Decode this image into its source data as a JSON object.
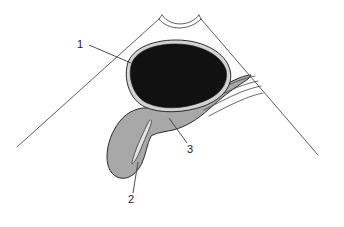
{
  "figure": {
    "background_color": "#ffffff",
    "width": 344,
    "height": 227
  },
  "palette": {
    "background": "#ffffff",
    "outline": "#2b2b2b",
    "frame_line": "#4a4a4a",
    "leader_line": "#3a3a3a",
    "dark_organ_fill": "#111111",
    "dark_organ_rim": "#cfcfcf",
    "shaded_organ_fill": "#a8a8a8",
    "lumen_fill": "#e8e8e8",
    "label_text": "#1a1a1a"
  },
  "callouts": [
    {
      "id": "callout-1",
      "label": "1",
      "label_x": 80,
      "label_y": 48,
      "leader_from_x": 89,
      "leader_from_y": 45,
      "leader_to_x": 131,
      "leader_to_y": 63,
      "points_to": "dark-organ"
    },
    {
      "id": "callout-2",
      "label": "2",
      "label_x": 129,
      "label_y": 202,
      "leader_from_x": 133,
      "leader_from_y": 193,
      "leader_to_x": 138,
      "leader_to_y": 162,
      "points_to": "shaded-organ-fundus"
    },
    {
      "id": "callout-3",
      "label": "3",
      "label_x": 187,
      "label_y": 152,
      "leader_from_x": 188,
      "leader_from_y": 143,
      "leader_to_x": 170,
      "leader_to_y": 119,
      "points_to": "shaded-organ-body"
    }
  ],
  "shapes": {
    "left_frame_line": {
      "name": "left-body-wall-line",
      "x1": 17,
      "y1": 147,
      "x2": 159,
      "y2": 19
    },
    "right_frame_line": {
      "name": "right-body-wall-line",
      "x1": 201,
      "y1": 19,
      "x2": 318,
      "y2": 155
    },
    "apex_notch": {
      "name": "apex-notch-curve",
      "outer_path": "M 159,19 C 168,31 190,31 201,19",
      "inner_path": "M 162,16 C 170,27 190,27 199,16"
    },
    "dark_organ": {
      "name": "dark-organ-liver",
      "rim_path": "M 129,63 C 134,48 152,41 176,41 C 203,41 224,53 228,69 C 232,84 222,98 205,104 C 186,111 162,112 146,106 C 131,100 125,79 129,63 Z",
      "fill_path": "M 132,64 C 137,51 153,44 176,44 C 201,44 221,55 225,69 C 228,83 219,96 203,101 C 185,108 163,109 148,103 C 134,97 128,78 132,64 Z"
    },
    "shaded_organ": {
      "name": "shaded-organ-gallbladder",
      "body_path": "M 150,109 C 167,110 186,106 201,98 C 214,91 226,84 238,79 C 243,77 247,76 250,76 C 249,79 246,81 241,84 C 230,91 219,100 208,110 C 196,121 184,128 172,131 C 162,133 155,134 150,137 C 146,145 145,155 141,164 C 136,174 128,180 120,178 C 112,176 108,167 108,157 C 108,145 113,132 121,122 C 129,112 139,108 150,109 Z"
    },
    "lumen": {
      "name": "organ-lumen-cleft",
      "path": "M 148,122 C 145,128 140,138 136,148 C 133,156 131,161 131,164 C 133,163 136,158 139,151 C 143,141 148,130 150,124 C 151,121 150,120 148,122 Z"
    },
    "duct_bundle": {
      "name": "duct-bundle",
      "paths": [
        "M 196,101 C 209,95 222,88 234,83 C 242,80 249,78 254,77",
        "M 199,105 C 212,99 225,92 237,87 C 245,84 252,82 257,81",
        "M 203,110 C 215,104 228,97 240,92 C 248,89 255,87 260,86",
        "M 208,115 C 219,109 231,103 243,98 C 250,95 257,93 262,92"
      ]
    }
  }
}
